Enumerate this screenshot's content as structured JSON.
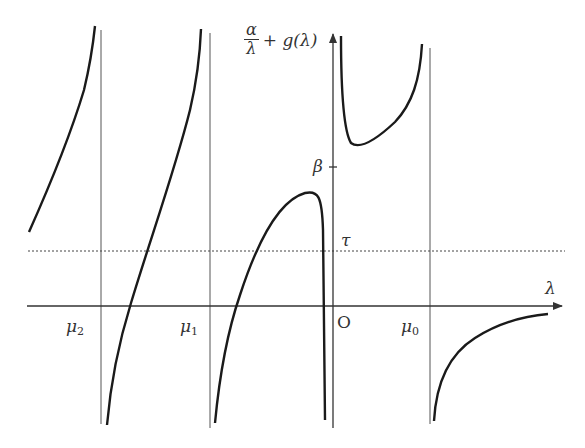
{
  "diagram": {
    "y_axis_label": {
      "numerator": "α",
      "denominator": "λ",
      "rest": "+ g(λ)"
    },
    "x_axis_label": "λ",
    "origin_label": "O",
    "ticks": {
      "beta": "β",
      "tau": "τ"
    },
    "asymptotes": [
      {
        "symbol": "μ",
        "index": "2"
      },
      {
        "symbol": "μ",
        "index": "1"
      },
      {
        "symbol": "μ",
        "index": "0"
      }
    ],
    "colors": {
      "curve": "#1a1a1a",
      "axis": "#333333",
      "asymptote": "#555555",
      "dotted": "#444444"
    }
  }
}
